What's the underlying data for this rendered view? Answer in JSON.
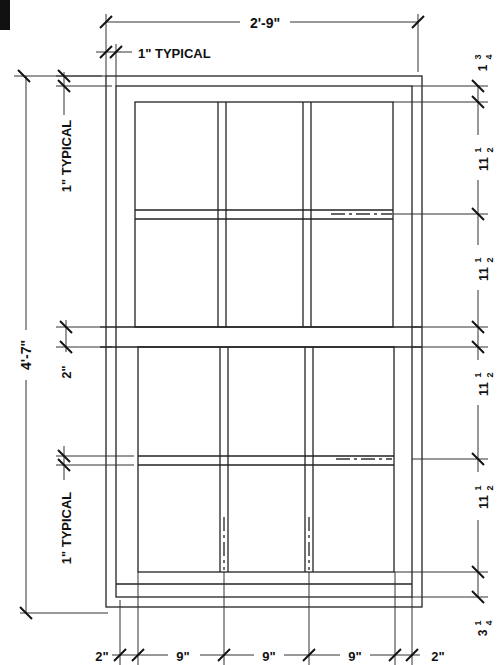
{
  "drawing": {
    "title": "Double-hung window elevation",
    "line_color": "#222222",
    "background": "#ffffff"
  },
  "dimensions": {
    "overall_width": "2'-9\"",
    "overall_height": "4'-7\"",
    "frame_typical_top": "1\" TYPICAL",
    "frame_typical_left_upper": "1\" TYPICAL",
    "frame_typical_left_lower": "1\" TYPICAL",
    "meeting_rail": "2\"",
    "right_top": "1 3/4",
    "right_top_whole": "1",
    "right_top_num": "3",
    "right_top_den": "4",
    "right_pane": [
      {
        "whole": "11",
        "num": "1",
        "den": "2"
      },
      {
        "whole": "11",
        "num": "1",
        "den": "2"
      },
      {
        "whole": "11",
        "num": "1",
        "den": "2"
      },
      {
        "whole": "11",
        "num": "1",
        "den": "2"
      }
    ],
    "right_bottom": {
      "whole": "3",
      "num": "1",
      "den": "4"
    },
    "bottom": [
      "2\"",
      "9\"",
      "9\"",
      "9\"",
      "2\""
    ]
  }
}
